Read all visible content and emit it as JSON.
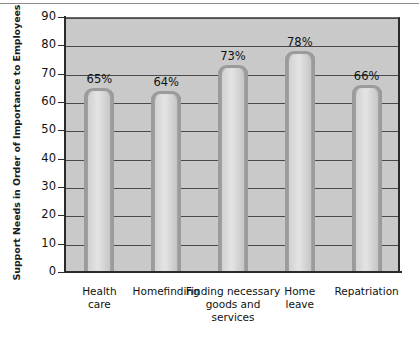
{
  "chart_data": {
    "type": "bar",
    "title": "",
    "subtitle": "",
    "xlabel": "",
    "ylabel": "Support Needs in Order of Importance to Employees",
    "categories": [
      "Health care",
      "Homefinding",
      "Finding necessary goods and services",
      "Home leave",
      "Repatriation"
    ],
    "category_lines": [
      [
        "Health",
        "care"
      ],
      [
        "Homefinding"
      ],
      [
        "Finding necessary",
        "goods and",
        "services"
      ],
      [
        "Home",
        "leave"
      ],
      [
        "Repatriation"
      ]
    ],
    "values": [
      65,
      64,
      73,
      78,
      66
    ],
    "data_labels": [
      "65%",
      "64%",
      "73%",
      "78%",
      "66%"
    ],
    "ylim": [
      0,
      90
    ],
    "ytick_step": 10,
    "yticks": [
      0,
      10,
      20,
      30,
      40,
      50,
      60,
      70,
      80,
      90
    ],
    "ytick_labels": [
      "0",
      "10",
      "20",
      "30",
      "40",
      "50",
      "60",
      "70",
      "80",
      "90"
    ],
    "grid": true,
    "grid_axis": "y",
    "legend": false,
    "legend_position": "none",
    "units": "percent",
    "colors": {
      "plot_background": "#c9c9c9",
      "page_background": "#ffffff",
      "bar_fill": "#dcdcdc",
      "bar_outline": "#9b9b9b",
      "gridline": "#4a4a4a",
      "axis": "#2b2b2b",
      "text": "#111111"
    }
  }
}
